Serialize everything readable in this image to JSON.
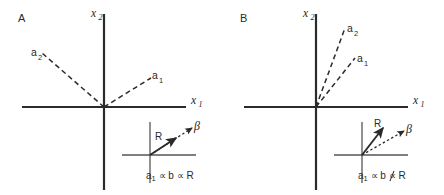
{
  "figure": {
    "panels": [
      {
        "id": "A",
        "label": "A",
        "axes": {
          "x_label": "x",
          "x_sub": "1",
          "y_label": "x",
          "y_sub": "2"
        },
        "vectors": [
          {
            "name": "a1",
            "label": "a",
            "sub": "1",
            "angle_deg": 42,
            "length": 72,
            "style": "dashed"
          },
          {
            "name": "a2",
            "label": "a",
            "sub": "2",
            "angle_deg": 139,
            "length": 82,
            "style": "dashed"
          }
        ],
        "inset": {
          "vectors": [
            {
              "name": "R",
              "label": "R",
              "angle_deg": 33,
              "length": 40,
              "style": "solid"
            },
            {
              "name": "beta",
              "label": "β",
              "angle_deg": 33,
              "length": 62,
              "style": "dashed"
            }
          ],
          "collinear": true
        },
        "caption": {
          "lead": "a",
          "lead_sub": "1",
          "rel1": "∝",
          "mid": "b",
          "rel2": "∝",
          "tail": "R",
          "rel2_crossed": false,
          "full_text": "a1 ∝ b ∝ R"
        }
      },
      {
        "id": "B",
        "label": "B",
        "axes": {
          "x_label": "x",
          "x_sub": "1",
          "y_label": "x",
          "y_sub": "2"
        },
        "vectors": [
          {
            "name": "a1",
            "label": "a",
            "sub": "1",
            "angle_deg": 52,
            "length": 62,
            "style": "dashed"
          },
          {
            "name": "a2",
            "label": "a",
            "sub": "2",
            "angle_deg": 70,
            "length": 84,
            "style": "dashed"
          }
        ],
        "inset": {
          "vectors": [
            {
              "name": "R",
              "label": "R",
              "angle_deg": 55,
              "length": 37,
              "style": "solid"
            },
            {
              "name": "beta",
              "label": "β",
              "angle_deg": 27,
              "length": 62,
              "style": "dashed"
            }
          ],
          "collinear": false
        },
        "caption": {
          "lead": "a",
          "lead_sub": "1",
          "rel1": "∝",
          "mid": "b",
          "rel2": "∝",
          "tail": "R",
          "rel2_crossed": true,
          "full_text": "a1 ∝ b ∝̸ R"
        }
      }
    ],
    "colors": {
      "axis": "#2b2b2b",
      "inset_axis": "#555555",
      "vector": "#2a2a2a",
      "text": "#2a2a2a",
      "background": "#ffffff"
    }
  }
}
